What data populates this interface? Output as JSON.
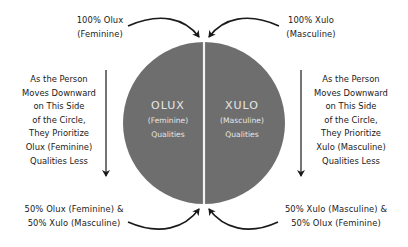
{
  "diagram": {
    "circle": {
      "fill": "#6e6e6e",
      "divider_color": "#f2f2f2",
      "left_half": {
        "title": "OLUX",
        "subtitle": "(Feminine)",
        "caption": "Qualities"
      },
      "right_half": {
        "title": "XULO",
        "subtitle": "(Masculine)",
        "caption": "Qualities"
      }
    },
    "top_left_label": {
      "line1": "100% Olux",
      "line2": "(Feminine)"
    },
    "top_right_label": {
      "line1": "100% Xulo",
      "line2": "(Masculine)"
    },
    "bottom_left_label": {
      "line1": "50% Olux (Feminine) &",
      "line2": "50% Xulo (Masculine)"
    },
    "bottom_right_label": {
      "line1": "50% Xulo (Masculine) &",
      "line2": "50% Olux (Feminine)"
    },
    "left_side_text": {
      "lines": [
        "As the Person",
        "Moves Downward",
        "on This Side",
        "of the Circle,",
        "They Prioritize",
        "Olux (Feminine)",
        "Qualities Less"
      ]
    },
    "right_side_text": {
      "lines": [
        "As the Person",
        "Moves Downward",
        "on This Side",
        "of the Circle,",
        "They Prioritize",
        "Xulo (Masculine)",
        "Qualities Less"
      ]
    },
    "arrow_color": "#1a1a1a"
  }
}
